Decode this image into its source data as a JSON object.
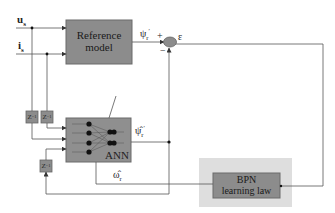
{
  "diagram": {
    "inputs": {
      "u_s": "u",
      "u_s_sub": "s",
      "i_s": "i",
      "i_s_sub": "s"
    },
    "reference_model": {
      "line1": "Reference",
      "line2": "model"
    },
    "summing_junction": {
      "plus": "+",
      "minus": "−",
      "error_label": "ε"
    },
    "psi_r_ref": {
      "symbol": "ψ",
      "sub": "r",
      "sup": "′"
    },
    "ann": {
      "label": "ANN",
      "psi_r_est": {
        "symbol": "ψ̂",
        "sub": "r",
        "sup": "′"
      },
      "omega_r_est": {
        "symbol": "ω̂",
        "sub": "r"
      }
    },
    "delays": [
      {
        "label": "Z",
        "exp": "−1"
      },
      {
        "label": "Z",
        "exp": "−1"
      },
      {
        "label": "Z",
        "exp": "−1"
      }
    ],
    "bpn": {
      "line1": "BPN",
      "line2": "learning law"
    },
    "colors": {
      "block_fill": "#8c8c8c",
      "block_stroke": "#5a5a5a",
      "bpn_bg": "#dcdcdc",
      "line": "#555555",
      "node": "#111111"
    }
  }
}
